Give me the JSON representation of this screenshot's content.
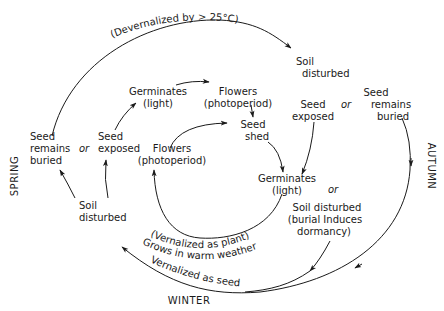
{
  "seasons": {
    "spring": "SPRING",
    "autumn": "AUTUMN",
    "winter": "WINTER"
  },
  "nodes": {
    "soil_disturbed_top": [
      "Soil",
      "disturbed"
    ],
    "germinates_light_upper": [
      "Germinates",
      "(light)"
    ],
    "flowers_photoperiod_upper": [
      "Flowers",
      "(photoperiod)"
    ],
    "seed_exposed_right": [
      "Seed",
      "exposed"
    ],
    "seed_remains_buried_right": [
      "Seed",
      "remains",
      "buried"
    ],
    "seed_shed": [
      "Seed",
      "shed"
    ],
    "seed_remains_buried_left": [
      "Seed",
      "remains",
      "buried"
    ],
    "seed_exposed_left": [
      "Seed",
      "exposed"
    ],
    "flowers_photoperiod_lower": [
      "Flowers",
      "(photoperiod)"
    ],
    "germinates_light_lower": [
      "Germinates",
      "(light)"
    ],
    "soil_disturbed_left": [
      "Soil",
      "disturbed"
    ],
    "soil_disturbed_burial": [
      "Soil disturbed",
      "(burial Induces",
      "dormancy)"
    ]
  },
  "connectors": {
    "or_left": "or",
    "or_right": "or",
    "or_lower": "or"
  },
  "curve_labels": {
    "devernalized": "(Devernalized by > 25°C)",
    "vernalized_as_plant": "(Vernalized as plant)",
    "grows_in_warm_weather": "Grows in warm weather",
    "vernalized_as_seed": "Vernalized as seed"
  },
  "colors": {
    "ink": "#1a1a1a",
    "background": "#ffffff"
  }
}
